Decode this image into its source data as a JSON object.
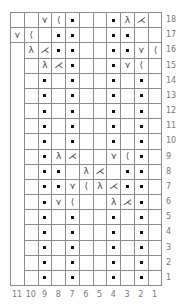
{
  "chart": {
    "title": "",
    "type": "knitting-chart",
    "columns": 11,
    "rows": 18,
    "column_labels": [
      "11",
      "10",
      "9",
      "8",
      "7",
      "6",
      "5",
      "4",
      "3",
      "2",
      "1"
    ],
    "row_labels": [
      "18",
      "17",
      "16",
      "15",
      "14",
      "13",
      "12",
      "11",
      "10",
      "9",
      "8",
      "7",
      "6",
      "5",
      "4",
      "3",
      "2",
      "1"
    ],
    "symbols": {
      "purl": "•",
      "right-cross-left": "⋎",
      "right-cross-right": "⟨",
      "left-cross-left": "λ",
      "left-cross-right": "⋌",
      "knit": ""
    },
    "grid_rows": [
      {
        "row": 18,
        "cells": [
          "",
          "",
          "⋎",
          "⟨",
          "•",
          "",
          "",
          "•",
          "λ",
          "⋌",
          ""
        ]
      },
      {
        "row": 17,
        "cells": [
          "⋎",
          "⟨",
          "",
          "•",
          "•",
          "",
          "",
          "•",
          "•",
          "",
          ""
        ]
      },
      {
        "row": 16,
        "cells": [
          "",
          "λ",
          "⋌",
          "•",
          "•",
          "",
          "",
          "•",
          "•",
          "⋎",
          "⟨"
        ]
      },
      {
        "row": 15,
        "cells": [
          "",
          "",
          "λ",
          "⋌",
          "•",
          "",
          "",
          "•",
          "⋎",
          "⟨",
          ""
        ]
      },
      {
        "row": 14,
        "cells": [
          "",
          "",
          "•",
          "",
          "•",
          "",
          "",
          "•",
          "",
          "•",
          ""
        ]
      },
      {
        "row": 13,
        "cells": [
          "",
          "",
          "•",
          "",
          "•",
          "",
          "",
          "•",
          "",
          "•",
          ""
        ]
      },
      {
        "row": 12,
        "cells": [
          "",
          "",
          "•",
          "",
          "•",
          "",
          "",
          "•",
          "",
          "•",
          ""
        ]
      },
      {
        "row": 11,
        "cells": [
          "",
          "",
          "•",
          "",
          "•",
          "",
          "",
          "•",
          "",
          "•",
          ""
        ]
      },
      {
        "row": 10,
        "cells": [
          "",
          "",
          "•",
          "",
          "•",
          "",
          "",
          "•",
          "",
          "•",
          ""
        ]
      },
      {
        "row": 9,
        "cells": [
          "",
          "",
          "•",
          "λ",
          "⋌",
          "",
          "",
          "⋎",
          "⟨",
          "•",
          ""
        ]
      },
      {
        "row": 8,
        "cells": [
          "",
          "",
          "•",
          "•",
          "",
          "λ",
          "⋌",
          "",
          "•",
          "•",
          ""
        ]
      },
      {
        "row": 7,
        "cells": [
          "",
          "",
          "•",
          "•",
          "⋎",
          "⟨",
          "λ",
          "⋌",
          "•",
          "•",
          ""
        ]
      },
      {
        "row": 6,
        "cells": [
          "",
          "",
          "•",
          "⋎",
          "⟨",
          "",
          "",
          "λ",
          "⋌",
          "•",
          ""
        ]
      },
      {
        "row": 5,
        "cells": [
          "",
          "",
          "•",
          "",
          "•",
          "",
          "",
          "•",
          "",
          "•",
          ""
        ]
      },
      {
        "row": 4,
        "cells": [
          "",
          "",
          "•",
          "",
          "•",
          "",
          "",
          "•",
          "",
          "•",
          ""
        ]
      },
      {
        "row": 3,
        "cells": [
          "",
          "",
          "•",
          "",
          "•",
          "",
          "",
          "•",
          "",
          "•",
          ""
        ]
      },
      {
        "row": 2,
        "cells": [
          "",
          "",
          "•",
          "",
          "•",
          "",
          "",
          "•",
          "",
          "•",
          ""
        ]
      },
      {
        "row": 1,
        "cells": [
          "",
          "",
          "•",
          "",
          "•",
          "",
          "",
          "•",
          "",
          "•",
          ""
        ]
      }
    ],
    "colors": {
      "grid_line": "#8c8c8c",
      "label": "#7a7a7a",
      "dot": "#111111",
      "background": "#ffffff"
    }
  }
}
